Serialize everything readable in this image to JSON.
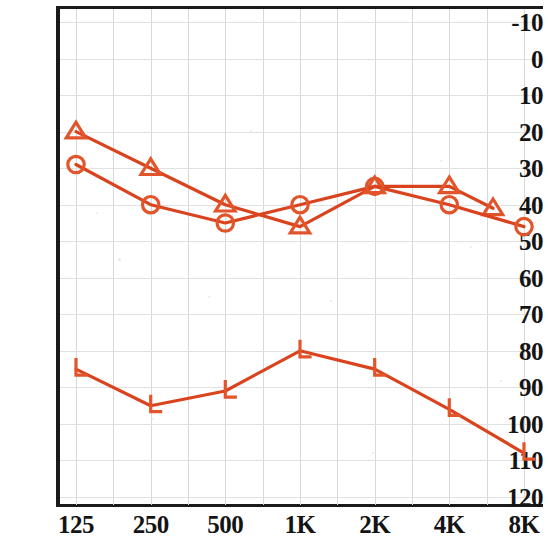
{
  "chart_data": {
    "type": "line",
    "title": "",
    "subtitle": "",
    "xlabel": "",
    "ylabel": "",
    "x": [
      125,
      250,
      500,
      1000,
      2000,
      4000,
      6000,
      8000
    ],
    "categories": [
      "125",
      "250",
      "500",
      "1K",
      "2K",
      "4K",
      "8K"
    ],
    "xtick_labels": [
      "125",
      "250",
      "500",
      "1K",
      "2K",
      "4K",
      "8K"
    ],
    "ytick_labels": [
      "-10",
      "0",
      "10",
      "20",
      "30",
      "40",
      "50",
      "60",
      "70",
      "80",
      "90",
      "100",
      "110",
      "120"
    ],
    "ytick_values": [
      -10,
      0,
      10,
      20,
      30,
      40,
      50,
      60,
      70,
      80,
      90,
      100,
      110,
      120
    ],
    "ylim": [
      -10,
      120
    ],
    "y_inverted": true,
    "grid": true,
    "legend": "none",
    "line_color": "#d9441f",
    "marker_color": "#e2552a",
    "axis_color": "#1b1b1b",
    "grid_color": "#dcdcdc",
    "series": [
      {
        "name": "air-conduction-triangle",
        "marker": "triangle",
        "x": [
          125,
          250,
          500,
          1000,
          2000,
          4000,
          6000
        ],
        "values": [
          20,
          30,
          40,
          46,
          35,
          35,
          41
        ]
      },
      {
        "name": "air-conduction-circle",
        "marker": "circle",
        "x": [
          125,
          250,
          500,
          1000,
          2000,
          4000,
          8000
        ],
        "values": [
          29,
          40,
          45,
          40,
          35,
          40,
          46
        ]
      },
      {
        "name": "no-response-corner",
        "marker": "corner-L",
        "x": [
          125,
          250,
          500,
          1000,
          2000,
          4000,
          8000
        ],
        "values": [
          85,
          95,
          91,
          80,
          85,
          96,
          108
        ]
      }
    ]
  },
  "axes": {
    "y_unit": "dB",
    "x_unit": "Hz"
  }
}
